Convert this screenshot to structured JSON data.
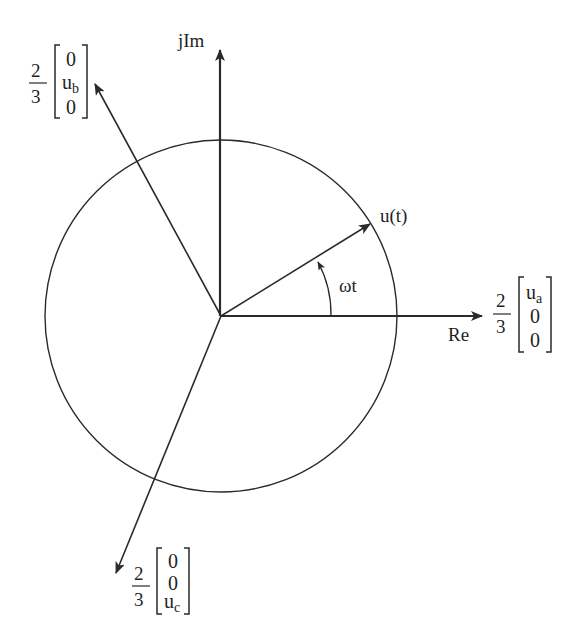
{
  "diagram": {
    "type": "space-vector phasor diagram",
    "axes": {
      "real_label": "Re",
      "imag_label": "jIm"
    },
    "rotating_vector": {
      "label": "u(t)",
      "angle_label": "ωt",
      "angle_deg": 32
    },
    "phase_vectors": {
      "a": {
        "coefficient_num": "2",
        "coefficient_den": "3",
        "row1": "u",
        "row1_sub": "a",
        "row2": "0",
        "row3": "0",
        "angle_deg": 0
      },
      "b": {
        "coefficient_num": "2",
        "coefficient_den": "3",
        "row1": "0",
        "row2": "u",
        "row2_sub": "b",
        "row3": "0",
        "angle_deg": 120
      },
      "c": {
        "coefficient_num": "2",
        "coefficient_den": "3",
        "row1": "0",
        "row2": "0",
        "row3": "u",
        "row3_sub": "c",
        "angle_deg": 240
      }
    },
    "circle": {
      "label": "locus of u(t)"
    },
    "colors": {
      "ink": "#2a2a2a",
      "background": "#ffffff"
    }
  }
}
